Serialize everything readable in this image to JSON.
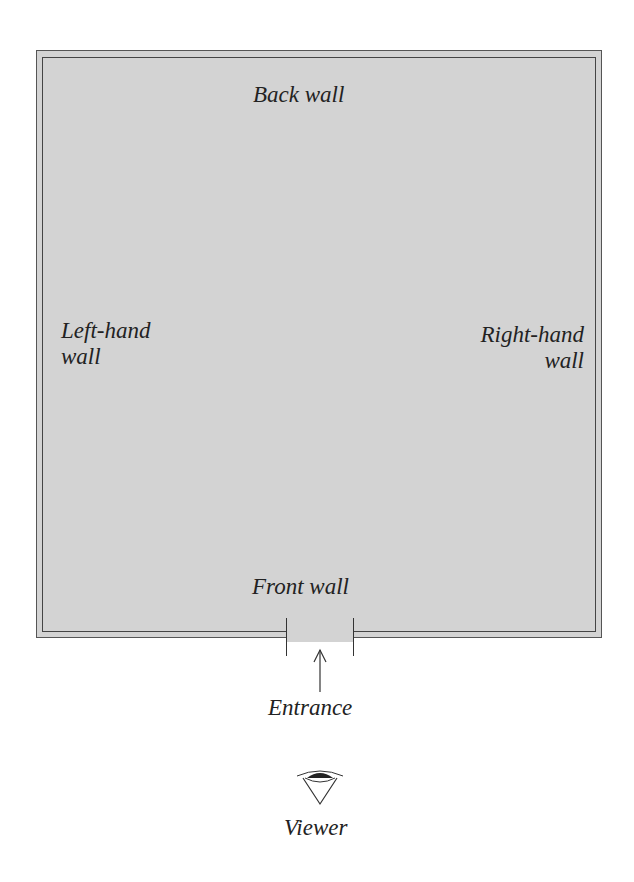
{
  "diagram": {
    "type": "room-floor-plan",
    "fill_color": "#d3d3d3",
    "labels": {
      "back_wall": "Back wall",
      "left_wall_line1": "Left-hand",
      "left_wall_line2": "wall",
      "right_wall_line1": "Right-hand",
      "right_wall_line2": "wall",
      "front_wall": "Front wall",
      "entrance": "Entrance",
      "viewer": "Viewer"
    },
    "icons": {
      "entrance_arrow": "arrow-up-icon",
      "viewer": "eye-icon"
    }
  }
}
